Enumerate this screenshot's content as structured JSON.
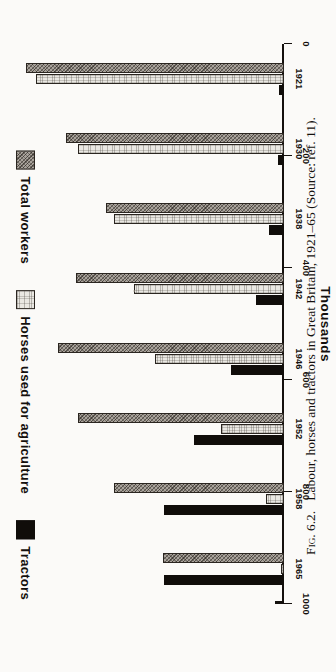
{
  "figure": {
    "caption_prefix": "Fig. 6.2.",
    "caption_text": "Labour, horses and tractors in Great Britain, 1921–65 (Source: ref. 11)."
  },
  "legend": {
    "items": [
      {
        "label": "Total workers",
        "key": "workers",
        "color": "#a9a39c"
      },
      {
        "label": "Horses used for agriculture",
        "key": "horses",
        "color": "#e9e7e2"
      },
      {
        "label": "Tractors",
        "key": "tractors",
        "color": "#100d0a"
      }
    ]
  },
  "axis": {
    "y_title": "Thousands",
    "ticks": [
      "0",
      "200",
      "400",
      "600",
      "800",
      "1000"
    ]
  },
  "chart_data": {
    "type": "bar",
    "title": "Labour, horses and tractors in Great Britain, 1921–65",
    "orientation": "horizontal",
    "xlabel": "",
    "ylabel": "Thousands",
    "ylim": [
      0,
      1000
    ],
    "grid": false,
    "legend_position": "top-left",
    "categories": [
      "1921",
      "1930",
      "1938",
      "1942",
      "1946",
      "1952",
      "1958",
      "1965"
    ],
    "series": [
      {
        "name": "Total workers",
        "values": [
          1000,
          845,
          690,
          805,
          875,
          800,
          660,
          470
        ]
      },
      {
        "name": "Horses used for agriculture",
        "values": [
          960,
          800,
          660,
          580,
          500,
          245,
          70,
          12
        ]
      },
      {
        "name": "Tractors",
        "values": [
          20,
          25,
          60,
          110,
          205,
          350,
          465,
          465
        ]
      }
    ]
  }
}
